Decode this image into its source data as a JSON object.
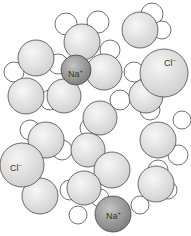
{
  "diagram": {
    "colors": {
      "oxygen": "#e6e6e6",
      "hydrogen": "#ffffff",
      "sodium": "#9a9a9a",
      "chloride": "#e2e2e2",
      "stroke": "#333333"
    },
    "labels": [
      {
        "id": "na-top",
        "ion": "Na",
        "charge": "+",
        "x": 76,
        "y": 74
      },
      {
        "id": "cl-right",
        "ion": "Cl",
        "charge": "−",
        "x": 165,
        "y": 64
      },
      {
        "id": "cl-left",
        "ion": "Cl",
        "charge": "−",
        "x": 9,
        "y": 170
      },
      {
        "id": "na-bottom",
        "ion": "Na",
        "charge": "+",
        "x": 109,
        "y": 218
      }
    ]
  }
}
